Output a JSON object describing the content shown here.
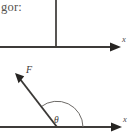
{
  "figure": {
    "caption_fragment": "gor:",
    "background_color": "#ffffff",
    "line_color": "#3d3b39",
    "arc_color": "#6d6a67",
    "width": 134,
    "height": 134
  },
  "top_diagram": {
    "name": "horizontal-axis-with-vertical-line",
    "axis_label": "x",
    "axis_y": 47,
    "axis_start_x": 0,
    "axis_end_x": 120,
    "vertical_line_x": 56,
    "vertical_line_top_y": 0,
    "vertical_line_bottom_y": 47,
    "arrow_direction": "right"
  },
  "bottom_diagram": {
    "name": "force-vector-angle-diagram",
    "axis_label": "x",
    "axis_y": 127,
    "axis_start_x": 0,
    "axis_end_x": 122,
    "origin_x": 57,
    "origin_y": 127,
    "force_label": "F",
    "force_tip_x": 16,
    "force_tip_y": 75,
    "angle_label": "θ",
    "angle_degrees": 128,
    "arc_radius": 26,
    "arrow_direction": "right"
  }
}
